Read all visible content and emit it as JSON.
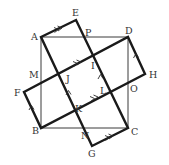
{
  "figure": {
    "type": "geometry-diagram",
    "colors": {
      "thick_line": "#1a1a1a",
      "thin_line": "#3a3a3a",
      "label": "#333333",
      "background": "#ffffff"
    },
    "points": {
      "A": {
        "label": "A",
        "x": 41,
        "y": 37
      },
      "B": {
        "label": "B",
        "x": 41,
        "y": 128
      },
      "C": {
        "label": "C",
        "x": 128,
        "y": 128
      },
      "D": {
        "label": "D",
        "x": 128,
        "y": 37
      },
      "E": {
        "label": "E",
        "x": 76,
        "y": 20
      },
      "F": {
        "label": "F",
        "x": 24,
        "y": 92
      },
      "G": {
        "label": "G",
        "x": 92,
        "y": 146
      },
      "H": {
        "label": "H",
        "x": 145,
        "y": 74
      },
      "I": {
        "label": "I"
      },
      "J": {
        "label": "J"
      },
      "K": {
        "label": "K"
      },
      "L": {
        "label": "L"
      },
      "M": {
        "label": "M"
      },
      "N": {
        "label": "N"
      },
      "O": {
        "label": "O"
      },
      "P": {
        "label": "P"
      }
    },
    "shapes": {
      "square": [
        "A",
        "B",
        "C",
        "D"
      ],
      "rectangle_1": [
        "A",
        "E",
        "C",
        "G"
      ],
      "rectangle_2": [
        "D",
        "H",
        "B",
        "F"
      ]
    },
    "parallel_marks": {
      "double_arrow_segments": [
        "AE",
        "GC",
        "JI",
        "KL"
      ],
      "single_arrow_segments": [
        "FB",
        "HD",
        "KJ",
        "LI"
      ]
    }
  }
}
